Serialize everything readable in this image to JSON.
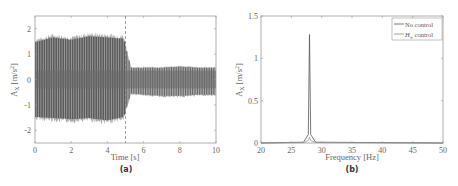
{
  "figure": {
    "panels": [
      {
        "caption": "(a)",
        "xlabel": "Time [s]",
        "ylabel": "A_X [m/s^2]",
        "ylabel_main": "A",
        "ylabel_sub": "X",
        "ylabel_unit": "[m/s",
        "ylabel_sup": "2",
        "ylabel_close": "]",
        "xticks": [
          "0",
          "2",
          "4",
          "6",
          "8",
          "10"
        ],
        "yticks": [
          "2",
          "1",
          "0",
          "-1",
          "-2"
        ]
      },
      {
        "caption": "(b)",
        "xlabel": "Frequency [Hz]",
        "ylabel": "A_X [m/s^2]",
        "ylabel_main": "A",
        "ylabel_sub": "X",
        "ylabel_unit": "[m/s",
        "ylabel_sup": "2",
        "ylabel_close": "]",
        "xticks": [
          "20",
          "25",
          "30",
          "35",
          "40",
          "45",
          "50"
        ],
        "yticks": [
          "1.5",
          "1",
          "0.5",
          "0"
        ],
        "legend": [
          {
            "label": "No control"
          },
          {
            "label_main": "H",
            "label_sub": "∞",
            "label_rest": " control"
          }
        ]
      }
    ]
  },
  "chart_data": [
    {
      "type": "line",
      "title": "(a)",
      "xlabel": "Time [s]",
      "ylabel": "A_X [m/s^2]",
      "xlim": [
        0,
        10
      ],
      "ylim": [
        -2.5,
        2.5
      ],
      "grid": false,
      "annotations": [
        {
          "type": "vertical-dashed-line",
          "x": 5
        }
      ],
      "series": [
        {
          "name": "Acceleration time history",
          "description": "Dense oscillation; envelope ~±1.6-1.9 for t<5 s (no control), drops to ~+0.5/-0.7 after t=5 s (control on)",
          "envelope": {
            "t": [
              0,
              1,
              2,
              3,
              4,
              4.9,
              5.3,
              6,
              7,
              8,
              9,
              10
            ],
            "upper": [
              1.6,
              1.8,
              1.7,
              1.85,
              1.8,
              1.75,
              0.5,
              0.5,
              0.5,
              0.55,
              0.5,
              0.5
            ],
            "lower": [
              -1.6,
              -1.65,
              -1.7,
              -1.65,
              -1.75,
              -1.6,
              -0.6,
              -0.65,
              -0.7,
              -0.7,
              -0.65,
              -0.65
            ]
          }
        }
      ]
    },
    {
      "type": "line",
      "title": "(b)",
      "xlabel": "Frequency [Hz]",
      "ylabel": "A_X [m/s^2]",
      "xlim": [
        20,
        50
      ],
      "ylim": [
        0,
        1.5
      ],
      "grid": false,
      "legend_position": "upper right",
      "series": [
        {
          "name": "No control",
          "x": [
            20,
            27,
            27.8,
            28.0,
            28.2,
            29,
            50
          ],
          "values": [
            0.0,
            0.01,
            0.1,
            1.28,
            0.1,
            0.01,
            0.0
          ]
        },
        {
          "name": "H∞ control",
          "x": [
            20,
            27,
            27.8,
            28.0,
            28.2,
            29,
            50
          ],
          "values": [
            0.0,
            0.005,
            0.03,
            0.07,
            0.03,
            0.005,
            0.0
          ]
        }
      ]
    }
  ]
}
